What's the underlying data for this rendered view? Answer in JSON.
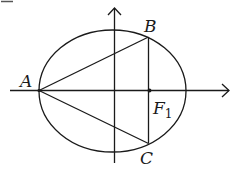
{
  "diagram": {
    "type": "ellipse-geometry",
    "points": {
      "A": {
        "label": "A",
        "desc": "left vertex of ellipse"
      },
      "B": {
        "label": "B",
        "desc": "upper intersection of vertical line through F1 with ellipse"
      },
      "C": {
        "label": "C",
        "desc": "lower intersection of vertical line through F1 with ellipse"
      },
      "F1": {
        "label": "F",
        "subscript": "1",
        "desc": "focus on x-axis"
      }
    },
    "segments": [
      "AB",
      "AC",
      "BC"
    ],
    "axes": {
      "x": "horizontal axis with arrow right",
      "y": "vertical axis with arrow up"
    },
    "colors": {
      "stroke": "#1a1a1a",
      "background": "#ffffff"
    }
  }
}
